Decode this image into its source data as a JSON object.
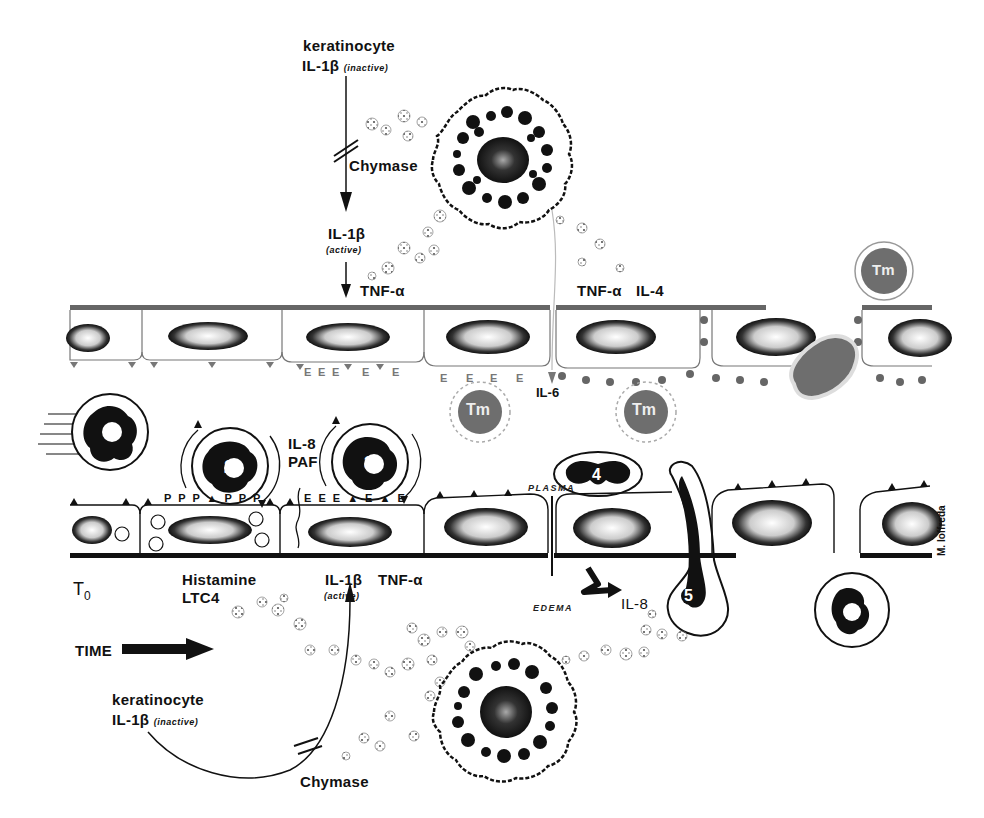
{
  "diagram": {
    "type": "biological-process-illustration",
    "credit": "M. Ioffreda",
    "top_pathway": {
      "source_label": "keratinocyte",
      "precursor": "IL-1β",
      "precursor_state": "(inactive)",
      "enzyme": "Chymase",
      "product": "IL-1β",
      "product_state": "(active)",
      "result": "TNF-α"
    },
    "upper_vessel": {
      "cytokines": [
        "TNF-α",
        "IL-4"
      ],
      "secondary": "IL-6",
      "cell_label": "Tm",
      "markers": [
        "E",
        "E",
        "E",
        "E",
        "E",
        "E",
        "E",
        "E",
        "E"
      ]
    },
    "leukocytes": [
      {
        "id": "1",
        "stage": "rolling"
      },
      {
        "id": "2",
        "stage": "tethering"
      },
      {
        "id": "3",
        "stage": "activation"
      },
      {
        "id": "4",
        "stage": "adhesion"
      },
      {
        "id": "5",
        "stage": "transmigration"
      },
      {
        "id": "6",
        "stage": "extravasated"
      }
    ],
    "mediators_mid": [
      "IL-8",
      "PAF"
    ],
    "lower_vessel": {
      "p_markers": "P P P ▲ P P P",
      "e_markers": "E E E ▲ E ▲ E",
      "plasma_label": "PLASMA",
      "edema_label": "EDEMA",
      "il8_label": "IL-8"
    },
    "bottom_pathway": {
      "time_origin": "T",
      "time_origin_sub": "0",
      "time_label": "TIME",
      "mediators": [
        "Histamine",
        "LTC4"
      ],
      "product": "IL-1β",
      "product_state": "(active)",
      "result": "TNF-α",
      "source_label": "keratinocyte",
      "precursor": "IL-1β",
      "precursor_state": "(inactive)",
      "enzyme": "Chymase"
    },
    "colors": {
      "ink": "#111111",
      "gray_cell": "#6e6e6e",
      "faint": "#9a9a9a",
      "background": "#ffffff"
    }
  }
}
